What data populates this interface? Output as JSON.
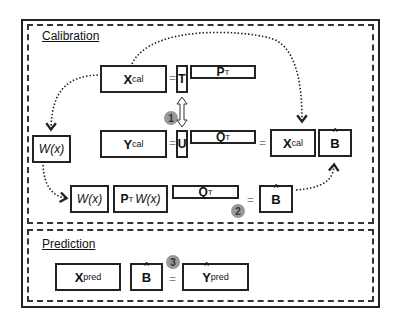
{
  "sections": {
    "calibration": {
      "title": "Calibration"
    },
    "prediction": {
      "title": "Prediction"
    }
  },
  "equations": {
    "x_decomp": {
      "lhs": {
        "main": "X",
        "sub": "cal"
      },
      "t": "T",
      "p": {
        "main": "P",
        "sup": "T"
      }
    },
    "y_decomp": {
      "lhs": {
        "main": "Y",
        "sub": "cal"
      },
      "u": "U",
      "q": {
        "main": "Q",
        "sup": "T"
      }
    },
    "relation": {
      "badge": "1",
      "arrow": "double-arrow"
    },
    "weight_left": {
      "label": "W(x)"
    },
    "result_row": {
      "x": {
        "main": "X",
        "sub": "cal"
      },
      "b": "B",
      "equals": "="
    },
    "weight_row": {
      "w": "W(x)",
      "ptw": {
        "p": "P",
        "sup": "T",
        "w": "W(x)"
      },
      "q": {
        "main": "Q",
        "sup": "T"
      },
      "equals": "=",
      "b": "B",
      "badge": "2"
    },
    "prediction_row": {
      "x": {
        "main": "X",
        "sub": "pred"
      },
      "b": "B",
      "equals": "=",
      "y": {
        "main": "Y",
        "sub": "pred"
      },
      "badge": "3"
    }
  },
  "colors": {
    "border": "#222222",
    "badge": "#999999",
    "equals": "#888888"
  }
}
